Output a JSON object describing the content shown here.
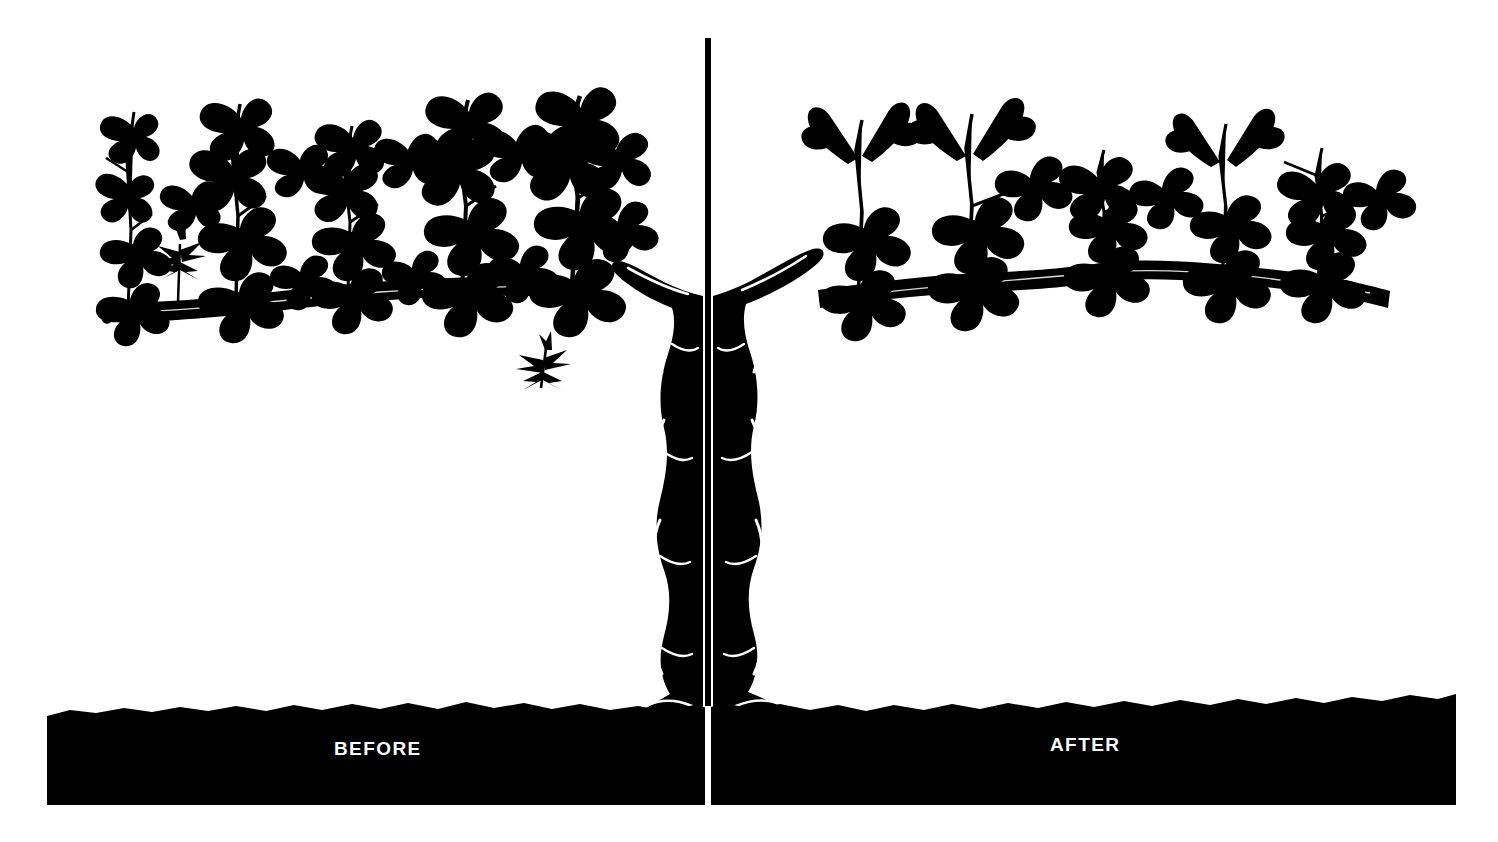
{
  "figure": {
    "type": "silhouette-illustration",
    "background_color": "#ffffff",
    "ink_color": "#000000",
    "width": 1498,
    "height": 842
  },
  "panels": {
    "left": {
      "label": "BEFORE",
      "label_color": "#ffffff",
      "state": "unpruned",
      "shoot_count": 5,
      "description": "dense overgrown canopy of long leafy shoots along the cordon"
    },
    "right": {
      "label": "AFTER",
      "label_color": "#ffffff",
      "state": "pruned",
      "shoot_count": 5,
      "description": "short spurs with few leaves along the cordon"
    }
  },
  "divider": {
    "name": "center-divider-line",
    "color_above_soil": "#000000",
    "color_in_soil": "#ffffff",
    "x": 708,
    "top": 38,
    "bottom": 805,
    "width": 6
  },
  "soil": {
    "name": "soil-band",
    "color": "#000000",
    "left": 47,
    "right": 1456,
    "top": 700,
    "bottom": 805,
    "edge": "irregular"
  },
  "trunk": {
    "name": "vine-trunk",
    "style": "twisted braided",
    "color": "#000000",
    "highlight_color": "#ffffff"
  },
  "details": {
    "falling_twig": "pruned twig falling away from trunk",
    "cut_branch_end": "cut cordon tip shown as open ellipse"
  }
}
